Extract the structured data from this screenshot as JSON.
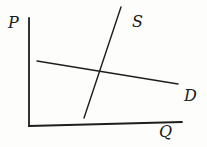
{
  "figure": {
    "width_px": 207,
    "height_px": 147,
    "background": "#fdfdfc",
    "ink_color": "#1e1e1e"
  },
  "chart_data": {
    "type": "line",
    "xlabel": "Q",
    "ylabel": "P",
    "grid": false,
    "legend": "inline labels at line ends",
    "axes": {
      "y_axis": {
        "label": "P",
        "pixel_line": [
          [
            29,
            18
          ],
          [
            29,
            126
          ]
        ],
        "stroke_width": 1.8
      },
      "x_axis": {
        "label": "Q",
        "pixel_line": [
          [
            29,
            126
          ],
          [
            182,
            122
          ]
        ],
        "stroke_width": 1.8
      }
    },
    "series": [
      {
        "name": "supply",
        "label": "S",
        "slope": "positive-steep",
        "pixel_points": [
          [
            84,
            118
          ],
          [
            121,
            7
          ]
        ],
        "stroke_width": 1.4
      },
      {
        "name": "demand",
        "label": "D",
        "slope": "negative-shallow",
        "pixel_points": [
          [
            37,
            61
          ],
          [
            178,
            84
          ]
        ],
        "stroke_width": 1.4
      }
    ],
    "equilibrium": {
      "pixel_point": [
        102,
        72
      ]
    },
    "labels": [
      {
        "id": "P",
        "text": "P",
        "x": 8,
        "y": 28
      },
      {
        "id": "S",
        "text": "S",
        "x": 132,
        "y": 27
      },
      {
        "id": "D",
        "text": "D",
        "x": 184,
        "y": 101
      },
      {
        "id": "Q",
        "text": "Q",
        "x": 159,
        "y": 137
      }
    ]
  }
}
